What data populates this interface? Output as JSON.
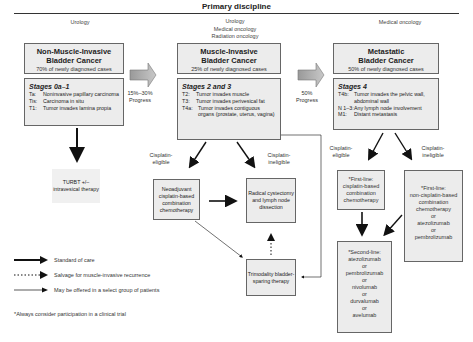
{
  "header": {
    "title": "Primary discipline"
  },
  "disciplines": {
    "left": [
      "Urology"
    ],
    "middle": [
      "Urology",
      "Medical oncology",
      "Radiation oncology"
    ],
    "right": [
      "Medical oncology"
    ]
  },
  "nmibc": {
    "title_line1": "Non-Muscle-Invasive",
    "title_line2": "Bladder Cancer",
    "subtitle": "70% of newly diagnosed cases",
    "stage_heading": "Stages 0a–1",
    "stages": [
      {
        "k": "Ta:",
        "v": "Noninvasive papillary carcinoma"
      },
      {
        "k": "Tis:",
        "v": "Carcinoma in situ"
      },
      {
        "k": "T1:",
        "v": "Tumor invades lamina propia"
      }
    ],
    "treatment": "TURBT +/– intravesical therapy"
  },
  "progress1": {
    "pct": "15%–30%",
    "label": "Progress"
  },
  "mibc": {
    "title_line1": "Muscle-Invasive",
    "title_line2": "Bladder Cancer",
    "subtitle": "25% of newly diagnosed cases",
    "stage_heading": "Stages 2 and 3",
    "stages": [
      {
        "k": "T2:",
        "v": "Tumor invades muscle"
      },
      {
        "k": "T3:",
        "v": "Tumor invades perivesical fat"
      },
      {
        "k": "T4a:",
        "v": "Tumor invades contiguous organs (prostate, uterus, vagina)"
      }
    ],
    "branch_eligible": "Cisplatin-eligible",
    "branch_ineligible": "Cisplatin-ineligible",
    "neoadjuvant": "Neoadjuvant cisplatin-based combination chemotherapy",
    "cystectomy": "Radical cystectomy and lymph node dissection",
    "trimodality": "Trimodality bladder-sparing therapy"
  },
  "progress2": {
    "pct": "50%",
    "label": "Progress"
  },
  "metastatic": {
    "title_line1": "Metastatic",
    "title_line2": "Bladder Cancer",
    "subtitle": "50% of newly diagnosed cases",
    "stage_heading": "Stages 4",
    "stages": [
      {
        "k": "T4b:",
        "v": "Tumor invades the pelvic wall, abdominal wall"
      },
      {
        "k": "N 1–3:",
        "v": "Any lymph node involvement"
      },
      {
        "k": "M1:",
        "v": "Distant metastasis"
      }
    ],
    "branch_eligible": "Cisplatin-eligible",
    "branch_ineligible": "Cisplatin-ineligible",
    "first_line_eligible": [
      "*First-line:",
      "cisplatin-based",
      "combination",
      "chemotherapy"
    ],
    "first_line_ineligible": [
      "*First-line:",
      "non-cisplatin-based",
      "combination",
      "chemotherapy",
      "or",
      "atezolizumab",
      "or",
      "pembrolizumab"
    ],
    "second_line": [
      "*Second-line:",
      "atezolizumab",
      "or",
      "pembrolizumab",
      "or",
      "nivolumab",
      "or",
      "durvalumab",
      "or",
      "avelumab"
    ]
  },
  "legend": [
    {
      "style": "solid-thick",
      "label": "Standard of care"
    },
    {
      "style": "dotted",
      "label": "Salvage for muscle-invasive recurrence"
    },
    {
      "style": "thin",
      "label": "May be offered in a select group of patients"
    }
  ],
  "footnote": "*Always consider participation in a clinical trial"
}
